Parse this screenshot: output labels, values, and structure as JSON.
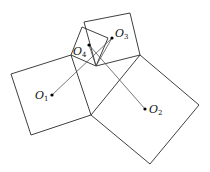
{
  "diagram": {
    "squares": [
      {
        "name": "left-square",
        "points": "11,74 71,55 91,115 31,135"
      },
      {
        "name": "right-square",
        "points": "140,55 199,105 150,164 91,115"
      },
      {
        "name": "top-square",
        "points": "84,22 130,13 140,55 96,66"
      },
      {
        "name": "small-square",
        "points": "71,55 82,27 108,38 96,66"
      }
    ],
    "segments": [
      {
        "name": "segment-o1-o3",
        "x1": 52,
        "y1": 95,
        "x2": 112,
        "y2": 38
      },
      {
        "name": "segment-o4-o2",
        "x1": 89,
        "y1": 45,
        "x2": 145,
        "y2": 109
      },
      {
        "name": "segment-o4-bottom",
        "x1": 89,
        "y1": 45,
        "x2": 96,
        "y2": 66
      },
      {
        "name": "segment-o3-bottom",
        "x1": 112,
        "y1": 38,
        "x2": 96,
        "y2": 66
      }
    ],
    "points": [
      {
        "name": "O1",
        "x": 52,
        "y": 95,
        "base": "O",
        "sub": "1",
        "lx": 35,
        "ly": 99
      },
      {
        "name": "O2",
        "x": 145,
        "y": 109,
        "base": "O",
        "sub": "2",
        "lx": 149,
        "ly": 113
      },
      {
        "name": "O3",
        "x": 112,
        "y": 38,
        "base": "O",
        "sub": "3",
        "lx": 115,
        "ly": 37
      },
      {
        "name": "O4",
        "x": 89,
        "y": 45,
        "base": "O",
        "sub": "4",
        "lx": 73,
        "ly": 55
      }
    ]
  }
}
